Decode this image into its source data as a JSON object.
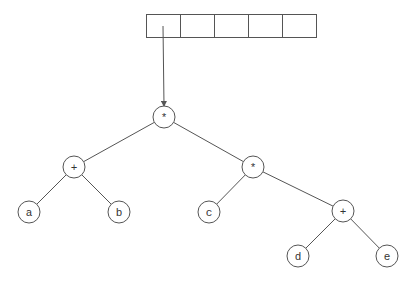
{
  "diagram": {
    "type": "expression-tree",
    "array": {
      "cells": [
        "",
        "",
        "",
        "",
        ""
      ],
      "x": 146,
      "y": 14,
      "cell_width": 34,
      "height": 23
    },
    "pointer": {
      "from": [
        163,
        26
      ],
      "to": [
        164,
        106
      ]
    },
    "nodes": [
      {
        "id": "root",
        "label": "*",
        "x": 164,
        "y": 117
      },
      {
        "id": "plus1",
        "label": "+",
        "x": 74,
        "y": 167
      },
      {
        "id": "mul2",
        "label": "*",
        "x": 253,
        "y": 167
      },
      {
        "id": "a",
        "label": "a",
        "x": 29,
        "y": 212
      },
      {
        "id": "b",
        "label": "b",
        "x": 119,
        "y": 212
      },
      {
        "id": "c",
        "label": "c",
        "x": 209,
        "y": 212
      },
      {
        "id": "plus2",
        "label": "+",
        "x": 343,
        "y": 211
      },
      {
        "id": "d",
        "label": "d",
        "x": 298,
        "y": 256
      },
      {
        "id": "e",
        "label": "e",
        "x": 387,
        "y": 256
      }
    ],
    "edges": [
      [
        "root",
        "plus1"
      ],
      [
        "root",
        "mul2"
      ],
      [
        "plus1",
        "a"
      ],
      [
        "plus1",
        "b"
      ],
      [
        "mul2",
        "c"
      ],
      [
        "mul2",
        "plus2"
      ],
      [
        "plus2",
        "d"
      ],
      [
        "plus2",
        "e"
      ]
    ],
    "radius": 11,
    "stroke": "#555555"
  }
}
